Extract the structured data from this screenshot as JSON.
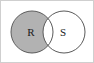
{
  "figure": {
    "type": "venn-diagram",
    "background_color": "#ffffff",
    "frame_color": "#cfcfcf",
    "width": 94,
    "height": 63
  },
  "chart_data": {
    "type": "venn",
    "title": "",
    "sets": [
      {
        "id": "R",
        "label": "R",
        "label_x": 30,
        "label_y": 31,
        "center_x": 31,
        "center_y": 31,
        "radius": 21,
        "fill": "#b2b2b2",
        "stroke": "#5a5a5a",
        "shaded": true
      },
      {
        "id": "S",
        "label": "S",
        "label_x": 62,
        "label_y": 31,
        "center_x": 63,
        "center_y": 31,
        "radius": 21,
        "fill": "#ffffff",
        "stroke": "#5a5a5a",
        "shaded": false
      }
    ],
    "regions": [
      {
        "id": "R-only",
        "label": "R ∖ S",
        "shaded": true,
        "fill": "#b2b2b2"
      },
      {
        "id": "R-and-S",
        "label": "R ∩ S",
        "shaded": false,
        "fill": "#ffffff"
      },
      {
        "id": "S-only",
        "label": "S ∖ R",
        "shaded": false,
        "fill": "#ffffff"
      }
    ],
    "shaded_region": "R ∖ S",
    "legend": [],
    "annotations": []
  }
}
